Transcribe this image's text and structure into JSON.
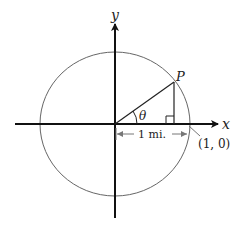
{
  "diagram": {
    "axis_x_label": "x",
    "axis_y_label": "y",
    "point_label": "P",
    "angle_label": "θ",
    "distance_label": "1 mi.",
    "intercept_label": "(1, 0)",
    "colors": {
      "axes": "#111111",
      "circle": "#666666",
      "lines": "#222222",
      "dimension": "#777777"
    }
  }
}
